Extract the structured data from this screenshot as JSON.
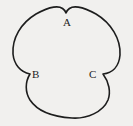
{
  "figure": {
    "type": "trefoil-curve-diagram",
    "background_color": "#f1f0ee",
    "stroke_color": "#1d1d1d",
    "stroke_width": 1.6,
    "labels": [
      {
        "id": "A",
        "text": "A",
        "x": 63,
        "y": 17,
        "cusp_x": 66,
        "cusp_y": 13
      },
      {
        "id": "B",
        "text": "B",
        "x": 32,
        "y": 69,
        "cusp_x": 30,
        "cusp_y": 74
      },
      {
        "id": "C",
        "text": "C",
        "x": 89,
        "y": 69,
        "cusp_x": 103,
        "cusp_y": 74
      }
    ],
    "lobes": [
      {
        "name": "upper-left-lobe",
        "center_x": 44,
        "center_y": 43,
        "radius": 32
      },
      {
        "name": "upper-right-lobe",
        "center_x": 89,
        "center_y": 43,
        "radius": 32
      },
      {
        "name": "bottom-lobe",
        "center_x": 66,
        "center_y": 82,
        "radius": 32
      }
    ],
    "path": "M 66 13 C 70 2 85 8 96 14 C 111 23 121 39 120 55 C 119 67 112 73 103 74 C 109 82 111 92 108 100 C 103 112 87 119 72 118 C 55 117 38 112 30 100 C 25 92 25 82 30 74 C 20 72 14 64 13 54 C 12 38 21 23 36 14 C 47 8 62 2 66 13 Z"
  }
}
